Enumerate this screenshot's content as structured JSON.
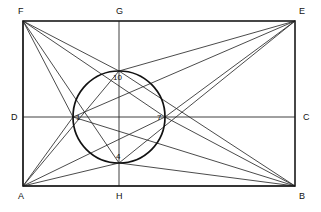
{
  "figure": {
    "background_color": "#ffffff",
    "line_color": "#2b2b2b",
    "frame_color": "#1a1a1a"
  },
  "rectangle": {
    "corners": [
      {
        "id": "F",
        "label": "F",
        "x": 23,
        "y": 21,
        "label_x": 18,
        "label_y": 14
      },
      {
        "id": "E",
        "label": "E",
        "x": 295,
        "y": 21,
        "label_x": 299,
        "label_y": 14
      },
      {
        "id": "B",
        "label": "B",
        "x": 295,
        "y": 186,
        "label_x": 299,
        "label_y": 199
      },
      {
        "id": "A",
        "label": "A",
        "x": 23,
        "y": 186,
        "label_x": 18,
        "label_y": 199
      }
    ]
  },
  "midpoints": [
    {
      "id": "G",
      "label": "G",
      "x": 119,
      "y": 21,
      "label_x": 116,
      "label_y": 14
    },
    {
      "id": "C",
      "label": "C",
      "x": 295,
      "y": 117,
      "label_x": 303,
      "label_y": 120
    },
    {
      "id": "H",
      "label": "H",
      "x": 119,
      "y": 186,
      "label_x": 116,
      "label_y": 199
    },
    {
      "id": "D",
      "label": "D",
      "x": 23,
      "y": 117,
      "label_x": 11,
      "label_y": 120
    }
  ],
  "circle": {
    "center_x": 119,
    "center_y": 117,
    "radius": 46
  },
  "circle_points": [
    {
      "id": "p1",
      "label": "1",
      "x": 73,
      "y": 117,
      "label_x": 76,
      "label_y": 120
    },
    {
      "id": "p4",
      "label": "4",
      "x": 119,
      "y": 163,
      "label_x": 116,
      "label_y": 159
    },
    {
      "id": "p7",
      "label": "7",
      "x": 165,
      "y": 117,
      "label_x": 157,
      "label_y": 120
    },
    {
      "id": "p10",
      "label": "10",
      "x": 119,
      "y": 71,
      "label_x": 113,
      "label_y": 80
    }
  ],
  "axes": [
    {
      "id": "horizontal-axis",
      "x1": 23,
      "y1": 117,
      "x2": 295,
      "y2": 117
    },
    {
      "id": "vertical-axis",
      "x1": 119,
      "y1": 21,
      "x2": 119,
      "y2": 186
    }
  ],
  "chords": [
    {
      "id": "F-to-1",
      "x1": 23,
      "y1": 21,
      "x2": 73,
      "y2": 117
    },
    {
      "id": "F-to-4",
      "x1": 23,
      "y1": 21,
      "x2": 119,
      "y2": 163
    },
    {
      "id": "F-to-7",
      "x1": 23,
      "y1": 21,
      "x2": 165,
      "y2": 117
    },
    {
      "id": "F-to-10",
      "x1": 23,
      "y1": 21,
      "x2": 119,
      "y2": 71
    },
    {
      "id": "F-to-A",
      "x1": 23,
      "y1": 21,
      "x2": 23,
      "y2": 186
    },
    {
      "id": "A-to-1",
      "x1": 23,
      "y1": 186,
      "x2": 73,
      "y2": 117
    },
    {
      "id": "A-to-10",
      "x1": 23,
      "y1": 186,
      "x2": 119,
      "y2": 71
    },
    {
      "id": "A-to-4",
      "x1": 23,
      "y1": 186,
      "x2": 119,
      "y2": 163
    },
    {
      "id": "A-to-7",
      "x1": 23,
      "y1": 186,
      "x2": 165,
      "y2": 117
    },
    {
      "id": "A-to-B",
      "x1": 23,
      "y1": 186,
      "x2": 295,
      "y2": 186
    },
    {
      "id": "E-to-10",
      "x1": 295,
      "y1": 21,
      "x2": 119,
      "y2": 71
    },
    {
      "id": "E-to-1",
      "x1": 295,
      "y1": 21,
      "x2": 73,
      "y2": 117
    },
    {
      "id": "E-to-7",
      "x1": 295,
      "y1": 21,
      "x2": 165,
      "y2": 117
    },
    {
      "id": "E-to-4",
      "x1": 295,
      "y1": 21,
      "x2": 119,
      "y2": 163
    },
    {
      "id": "B-to-7",
      "x1": 295,
      "y1": 186,
      "x2": 165,
      "y2": 117
    },
    {
      "id": "B-to-10",
      "x1": 295,
      "y1": 186,
      "x2": 119,
      "y2": 71
    },
    {
      "id": "B-to-4",
      "x1": 295,
      "y1": 186,
      "x2": 119,
      "y2": 163
    },
    {
      "id": "B-to-1",
      "x1": 295,
      "y1": 186,
      "x2": 73,
      "y2": 117
    }
  ]
}
